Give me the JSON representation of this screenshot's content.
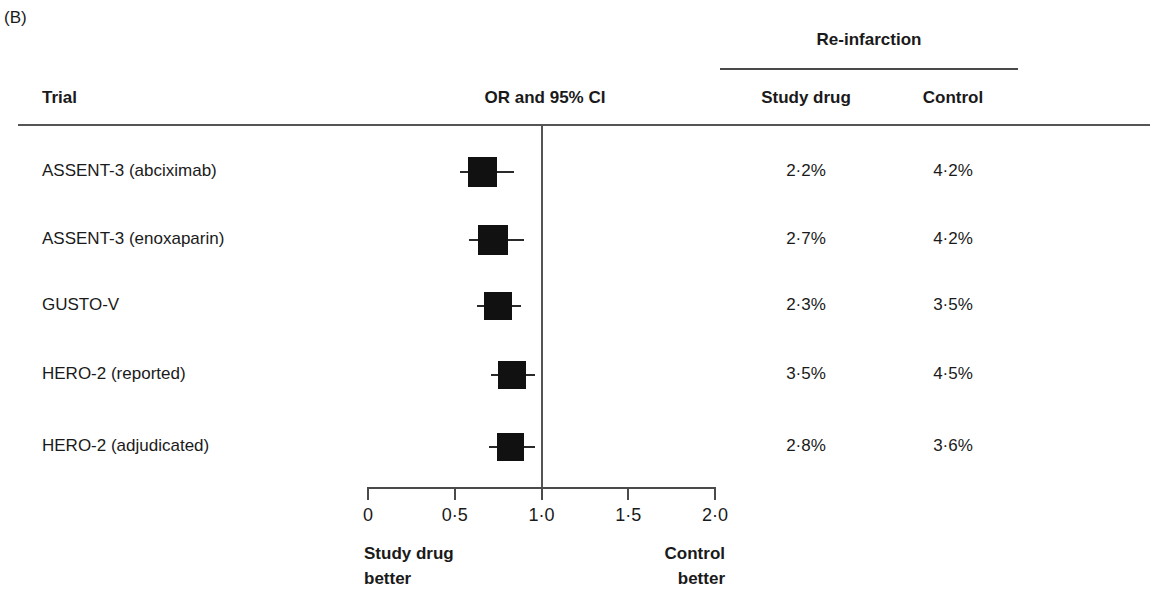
{
  "panel_label": "(B)",
  "header": {
    "trial_column": "Trial",
    "plot_column": "OR and 95% CI",
    "spanner_title": "Re-infarction",
    "study_drug_column": "Study drug",
    "control_column": "Control"
  },
  "axis": {
    "tick_labels": [
      "0",
      "0·0",
      "1·0",
      "1·5",
      "2·0"
    ],
    "ticks": [
      "0",
      "0·5",
      "1·0",
      "1·5",
      "2·0"
    ],
    "left_note_line1": "Study drug",
    "left_note_line2": "better",
    "right_note_line1": "Control",
    "right_note_line2": "better"
  },
  "colors": {
    "marker": "#111111",
    "rule": "#555555",
    "text": "#1a1a1a",
    "background": "#ffffff"
  },
  "chart_data": {
    "type": "forest",
    "title": "Re-infarction",
    "panel": "(B)",
    "xlabel": "OR and 95% CI",
    "ylabel": "Trial",
    "xlim": [
      0,
      2.0
    ],
    "xticks": [
      0,
      0.5,
      1.0,
      1.5,
      2.0
    ],
    "xtick_labels": [
      "0",
      "0·5",
      "1·0",
      "1·5",
      "2·0"
    ],
    "null_line": 1.0,
    "grid": false,
    "scale": "linear",
    "left_direction_note": "Study drug better",
    "right_direction_note": "Control better",
    "columns": [
      "Trial",
      "OR and 95% CI",
      "Study drug",
      "Control"
    ],
    "rows": [
      {
        "trial": "ASSENT-3 (abciximab)",
        "or": 0.66,
        "ci_low": 0.53,
        "ci_high": 0.84,
        "marker_weight": 0.72,
        "study_drug_pct": "2·2%",
        "control_pct": "4·2%"
      },
      {
        "trial": "ASSENT-3 (enoxaparin)",
        "or": 0.72,
        "ci_low": 0.58,
        "ci_high": 0.9,
        "marker_weight": 0.72,
        "study_drug_pct": "2·7%",
        "control_pct": "4·2%"
      },
      {
        "trial": "GUSTO-V",
        "or": 0.75,
        "ci_low": 0.63,
        "ci_high": 0.88,
        "marker_weight": 0.64,
        "study_drug_pct": "2·3%",
        "control_pct": "3·5%"
      },
      {
        "trial": "HERO-2 (reported)",
        "or": 0.83,
        "ci_low": 0.71,
        "ci_high": 0.96,
        "marker_weight": 0.68,
        "study_drug_pct": "3·5%",
        "control_pct": "4·5%"
      },
      {
        "trial": "HERO-2 (adjudicated)",
        "or": 0.82,
        "ci_low": 0.7,
        "ci_high": 0.96,
        "marker_weight": 0.58,
        "study_drug_pct": "2·8%",
        "control_pct": "3·6%"
      }
    ]
  }
}
